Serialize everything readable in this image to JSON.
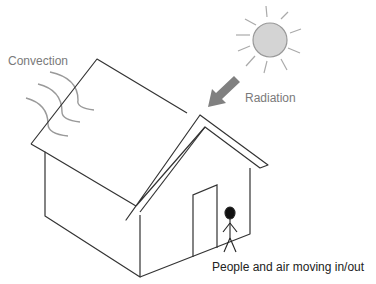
{
  "diagram": {
    "labels": {
      "convection": "Convection",
      "radiation": "Radiation",
      "people_air": "People and air moving  in/out"
    },
    "icons": {
      "sun": "sun-icon",
      "radiation_arrow": "arrow-down-left-icon",
      "convection_waves": "wave-arcs-icon",
      "person": "stick-figure-icon",
      "house": "house-icon",
      "door": "door-icon"
    },
    "colors": {
      "line": "#333333",
      "sun_fill": "#d4d4d4",
      "sun_stroke": "#999999",
      "arrow": "#808080",
      "waves": "#9a9a9a",
      "label_gray": "#7a7a7a"
    }
  }
}
